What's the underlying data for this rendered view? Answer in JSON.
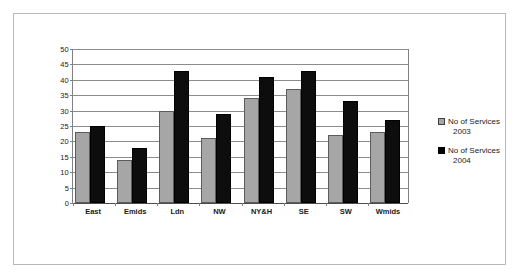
{
  "chart_data": {
    "type": "bar",
    "title": "",
    "subtitle": "",
    "xlabel": "",
    "ylabel": "",
    "ylim": [
      0,
      50
    ],
    "ytick_step": 5,
    "yticks": [
      50,
      45,
      40,
      35,
      30,
      25,
      20,
      15,
      10,
      5,
      0
    ],
    "grid": true,
    "legend_position": "right",
    "categories": [
      "East",
      "Emids",
      "Ldn",
      "NW",
      "NY&H",
      "SE",
      "SW",
      "Wmids"
    ],
    "series": [
      {
        "name": "No of Services 2003",
        "label_line1": "No of Services",
        "label_line2": "2003",
        "color": "#a6a6a6",
        "values": [
          23,
          14,
          30,
          21,
          34,
          37,
          22,
          23
        ]
      },
      {
        "name": "No of Services 2004",
        "label_line1": "No of Services",
        "label_line2": "2004",
        "color": "#000000",
        "values": [
          25,
          18,
          43,
          29,
          41,
          43,
          33,
          27
        ]
      }
    ]
  },
  "colors": {
    "series_2003": "#a6a6a6",
    "series_2004": "#000000",
    "gridline": "#8c8c8c",
    "frame_border": "#b9b9b9",
    "axis": "#808080",
    "text": "#1a1a1a",
    "background": "#ffffff"
  }
}
